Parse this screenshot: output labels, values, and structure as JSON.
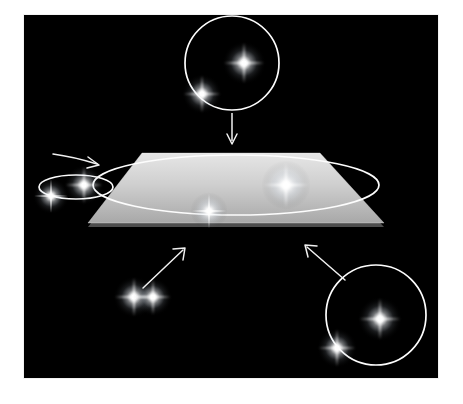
{
  "figure": {
    "domain": "Diagram",
    "title": "Binary star orbital inclination relative to reference plane",
    "background_color": "#000000",
    "frame_color": "#ffffff",
    "line_color": "#f2f2f2",
    "star_color": "#ffffff",
    "plane_color_top": "#d9d9d9",
    "plane_color_bottom": "#b0b0b0",
    "canvas": {
      "x": 24,
      "y": 15,
      "width": 414,
      "height": 363
    }
  },
  "reference_plane": {
    "label": "reference-plane",
    "shape": "parallelogram",
    "corners": [
      {
        "x": 118,
        "y": 138
      },
      {
        "x": 296,
        "y": 138
      },
      {
        "x": 360,
        "y": 208
      },
      {
        "x": 64,
        "y": 208
      }
    ],
    "thickness_px": 4,
    "orbit_ellipse": {
      "label": "orbit-in-plane",
      "cx": 212,
      "cy": 170,
      "rx": 143,
      "ry": 30,
      "stroke_width": 1.7
    },
    "stars": [
      {
        "name": "primary-star",
        "x": 262,
        "y": 170,
        "size": 26,
        "brightness": 1.0
      },
      {
        "name": "secondary-star",
        "x": 185,
        "y": 196,
        "size": 20,
        "brightness": 0.85
      }
    ]
  },
  "systems": [
    {
      "id": "top-system",
      "name": "face-on-binary-top",
      "inclination": "face-on",
      "orbit": {
        "shape": "circle",
        "cx": 208,
        "cy": 48,
        "r": 47,
        "stroke_width": 1.7
      },
      "stars": [
        {
          "name": "primary-star",
          "x": 220,
          "y": 48,
          "size": 23,
          "brightness": 1.0
        },
        {
          "name": "secondary-star",
          "x": 178,
          "y": 79,
          "size": 21,
          "brightness": 0.9
        }
      ],
      "arrow": {
        "name": "arrow-down-to-plane",
        "x1": 208,
        "y1": 98,
        "x2": 208,
        "y2": 128,
        "head_size": 7,
        "direction": "down"
      }
    },
    {
      "id": "left-system",
      "name": "inclined-binary-left",
      "inclination": "inclined",
      "orbit": {
        "shape": "ellipse",
        "cx": 52,
        "cy": 172,
        "rx": 37,
        "ry": 12,
        "stroke_width": 1.7
      },
      "stars": [
        {
          "name": "primary-star",
          "x": 60,
          "y": 170,
          "size": 21,
          "brightness": 1.0
        },
        {
          "name": "secondary-star",
          "x": 27,
          "y": 181,
          "size": 19,
          "brightness": 0.9
        }
      ],
      "arrow": {
        "name": "arrow-right-to-plane",
        "x1": 30,
        "y1": 140,
        "x2": 72,
        "y2": 148,
        "head_size": 6,
        "direction": "right"
      }
    },
    {
      "id": "bottom-left-system",
      "name": "edge-on-binary",
      "inclination": "edge-on",
      "orbit": {
        "shape": "line",
        "x1": 64,
        "y1": 282,
        "x2": 155,
        "y2": 282,
        "stroke_width": 1.7
      },
      "stars": [
        {
          "name": "primary-star",
          "x": 110,
          "y": 282,
          "size": 22,
          "brightness": 1.0
        },
        {
          "name": "secondary-star",
          "x": 129,
          "y": 282,
          "size": 20,
          "brightness": 0.95
        }
      ],
      "arrow": {
        "name": "arrow-up-right-to-plane",
        "x1": 120,
        "y1": 272,
        "x2": 161,
        "y2": 233,
        "head_size": 7,
        "direction": "up-right"
      }
    },
    {
      "id": "bottom-right-system",
      "name": "face-on-binary-bottom-right",
      "inclination": "face-on",
      "orbit": {
        "shape": "circle",
        "cx": 352,
        "cy": 300,
        "r": 50,
        "stroke_width": 1.7
      },
      "stars": [
        {
          "name": "primary-star",
          "x": 356,
          "y": 304,
          "size": 24,
          "brightness": 1.0
        },
        {
          "name": "secondary-star",
          "x": 313,
          "y": 333,
          "size": 21,
          "brightness": 0.9
        }
      ],
      "arrow": {
        "name": "arrow-up-left-to-plane",
        "x1": 320,
        "y1": 264,
        "x2": 281,
        "y2": 230,
        "head_size": 7,
        "direction": "up-left"
      }
    }
  ]
}
